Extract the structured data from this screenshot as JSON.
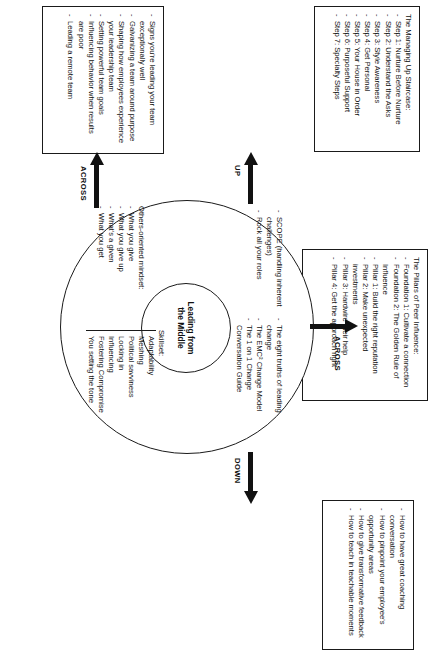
{
  "center": {
    "label": "Leading from\nthe Middle",
    "line1": "Leading from",
    "line2": "the Middle"
  },
  "clusters": {
    "scope": {
      "items": [
        "SCOPE (handling inherent challenges)",
        "Rock all your roles"
      ]
    },
    "change": {
      "items": [
        "The eight truths of leading change",
        "The EMC² Change Model",
        "The 1 on 1 Change Conversation Guide"
      ]
    },
    "mindset": {
      "heading": "Others-oriented mindset:",
      "items": [
        "What you give",
        "What you give up",
        "What's a given",
        "What you get"
      ]
    },
    "skillset": {
      "heading": "Skillset:",
      "items": [
        "Adaptability",
        "Meshing",
        "Political savviness",
        "Locking in",
        "Influencing",
        "Fostering Compromise",
        "You setting the tone"
      ]
    }
  },
  "arrows": {
    "up": "UP",
    "down": "DOWN",
    "across_peer": "ACROSS",
    "across_team": "ACROSS"
  },
  "boxes": {
    "up": {
      "heading": "The Managing Up Staircase:",
      "items": [
        "Step 1: Nurture Before Nurture",
        "Step 2: Understand the Asks",
        "Step 3: Style Awareness",
        "Step 4: Get Personal",
        "Step 5: Your House in Order",
        "Step 6: Purposeful Support",
        "Step 7: Specialty Steps"
      ]
    },
    "across_peer": {
      "heading": "The Pillars of Peer Influence:",
      "items": [
        "Foundation 1: Cultivate a connection",
        "Foundation 2: The Golden Rule of Influence",
        "Pillar 1: Build the right reputation",
        "Pillar 2: Make unexpected investments",
        "Pillar 3: Hardwire their help",
        "Pillar 4: Get the approach right"
      ]
    },
    "down": {
      "items": [
        "How to have great coaching conversation",
        "How to pinpoint your employee's opportunity areas",
        "How to give transformative feedback",
        "How to teach in teachable moments"
      ]
    },
    "across_team": {
      "items": [
        "Signs you're leading your team exceptionally well",
        "Galvanizing a team around purpose",
        "Shaping how employees experience your leadership team",
        "Setting powerful team goals",
        "Influencing behavior when results are poor",
        "Leading a remote team"
      ]
    }
  }
}
